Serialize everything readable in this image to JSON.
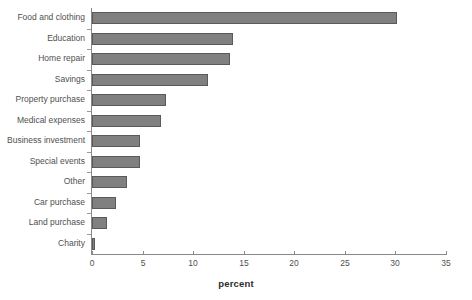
{
  "chart_data": {
    "type": "bar",
    "orientation": "horizontal",
    "title": "",
    "subtitle": "",
    "xlabel": "percent",
    "ylabel": "",
    "xlim": [
      0,
      35
    ],
    "ylim": [],
    "grid": false,
    "legend": false,
    "xticks": [
      0,
      5,
      10,
      15,
      20,
      25,
      30,
      35
    ],
    "xtick_labels": [
      "0",
      "5",
      "10",
      "15",
      "20",
      "25",
      "30",
      "35"
    ],
    "categories": [
      "Food and clothing",
      "Education",
      "Home repair",
      "Savings",
      "Property purchase",
      "Medical expenses",
      "Business investment",
      "Special events",
      "Other",
      "Car purchase",
      "Land purchase",
      "Charity"
    ],
    "values": [
      30.2,
      13.9,
      13.6,
      11.5,
      7.3,
      6.8,
      4.7,
      4.7,
      3.5,
      2.4,
      1.5,
      0.3
    ],
    "series": [
      {
        "name": "percent",
        "values": [
          30.2,
          13.9,
          13.6,
          11.5,
          7.3,
          6.8,
          4.7,
          4.7,
          3.5,
          2.4,
          1.5,
          0.3
        ]
      }
    ]
  },
  "style": {
    "bar_fill": "#808080",
    "bar_border": "#5a5a5a",
    "axis_color": "#8a8a8a",
    "text_color": "#4f4f4f",
    "background": "#ffffff"
  }
}
